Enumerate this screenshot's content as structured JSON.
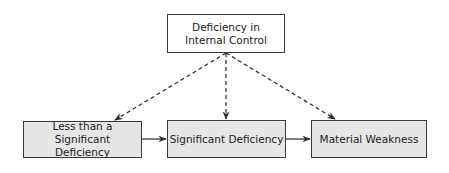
{
  "diagram": {
    "root": {
      "label": "Deficiency in Internal Control"
    },
    "nodes": [
      {
        "label": "Less than a Significant Deficiency"
      },
      {
        "label": "Significant Deficiency"
      },
      {
        "label": "Material Weakness"
      }
    ],
    "edges": [
      {
        "from": "Deficiency in Internal Control",
        "to": "Less than a Significant Deficiency",
        "style": "dashed"
      },
      {
        "from": "Deficiency in Internal Control",
        "to": "Significant Deficiency",
        "style": "dashed"
      },
      {
        "from": "Deficiency in Internal Control",
        "to": "Material Weakness",
        "style": "dashed"
      },
      {
        "from": "Less than a Significant Deficiency",
        "to": "Significant Deficiency",
        "style": "solid"
      },
      {
        "from": "Significant Deficiency",
        "to": "Material Weakness",
        "style": "solid"
      }
    ],
    "colors": {
      "border": "#3a3a3a",
      "bottom_fill": "#e6e6e6",
      "top_fill": "#ffffff"
    }
  }
}
